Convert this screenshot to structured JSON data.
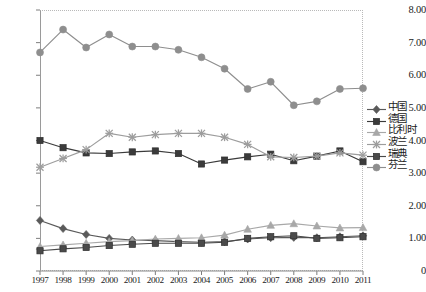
{
  "chart_data": {
    "type": "line",
    "title": "",
    "xlabel": "",
    "ylabel": "",
    "grid": false,
    "legend_position": "right",
    "ylim": [
      0,
      8
    ],
    "yticks": [
      0,
      1,
      2,
      3,
      4,
      5,
      6,
      7,
      8
    ],
    "ytick_labels": [
      "0",
      "1.00",
      "2.00",
      "3.00",
      "4.00",
      "5.00",
      "6.00",
      "7.00",
      "8.00"
    ],
    "categories": [
      "1997",
      "1998",
      "1999",
      "2000",
      "2001",
      "2002",
      "2003",
      "2004",
      "2005",
      "2006",
      "2007",
      "2008",
      "2009",
      "2010",
      "2011"
    ],
    "series": [
      {
        "name": "中国",
        "marker": "diamond",
        "color": "#5a5a5a",
        "values": [
          1.55,
          1.3,
          1.12,
          1.0,
          0.95,
          0.93,
          0.9,
          0.88,
          0.9,
          0.98,
          1.02,
          1.03,
          1.02,
          1.05,
          1.08
        ]
      },
      {
        "name": "德国",
        "marker": "square",
        "color": "#3b3b3b",
        "values": [
          4.0,
          3.78,
          3.62,
          3.6,
          3.65,
          3.68,
          3.6,
          3.28,
          3.4,
          3.5,
          3.58,
          3.38,
          3.52,
          3.68,
          3.35
        ]
      },
      {
        "name": "比利时",
        "marker": "triangle",
        "color": "#a8a8a8",
        "values": [
          0.75,
          0.8,
          0.85,
          0.9,
          0.93,
          0.98,
          1.0,
          1.02,
          1.1,
          1.28,
          1.4,
          1.45,
          1.38,
          1.32,
          1.33
        ]
      },
      {
        "name": "波兰",
        "marker": "star",
        "color": "#9d9d9d",
        "values": [
          3.18,
          3.45,
          3.72,
          4.22,
          4.1,
          4.18,
          4.22,
          4.22,
          4.1,
          3.88,
          3.5,
          3.48,
          3.52,
          3.62,
          3.55
        ]
      },
      {
        "name": "瑞典",
        "marker": "square",
        "color": "#4a4a4a",
        "values": [
          0.62,
          0.68,
          0.72,
          0.78,
          0.82,
          0.85,
          0.85,
          0.85,
          0.88,
          1.0,
          1.05,
          1.08,
          1.0,
          1.02,
          1.05
        ]
      },
      {
        "name": "芬兰",
        "marker": "circle",
        "color": "#8e8e8e",
        "values": [
          6.7,
          7.4,
          6.85,
          7.25,
          6.88,
          6.88,
          6.78,
          6.55,
          6.2,
          5.58,
          5.8,
          5.08,
          5.2,
          5.58,
          5.6
        ]
      }
    ]
  },
  "legend": {
    "items": [
      {
        "label": "中国"
      },
      {
        "label": "德国"
      },
      {
        "label": "比利时"
      },
      {
        "label": "波兰"
      },
      {
        "label": "瑞典"
      },
      {
        "label": "芬兰"
      }
    ]
  }
}
